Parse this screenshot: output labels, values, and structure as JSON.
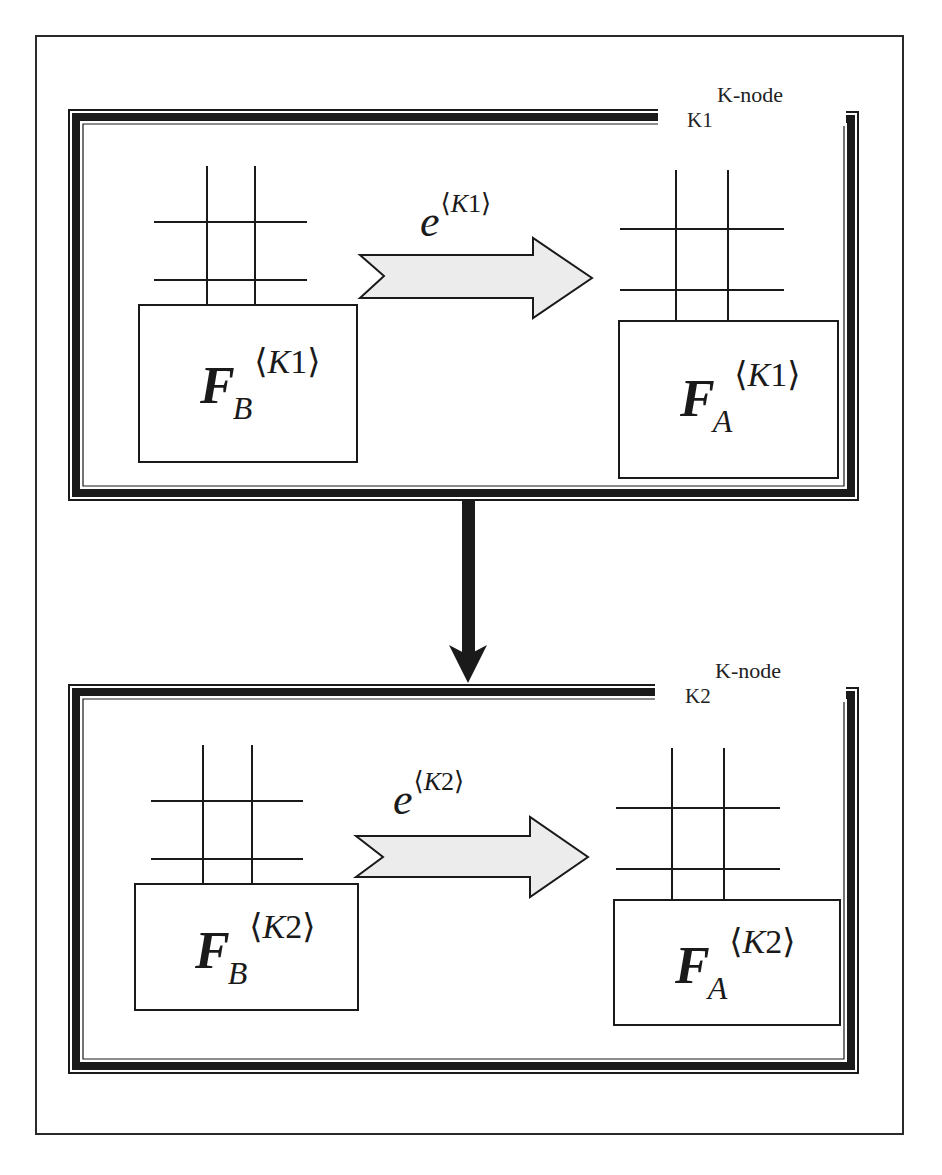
{
  "diagram": {
    "outer_frame": true,
    "colors": {
      "frame": "#1a1a1a",
      "arrow_fill": "#ececec",
      "arrow_stroke": "#1a1a1a",
      "background": "#ffffff"
    },
    "nodes": [
      {
        "id": "K1",
        "type_label": "K-node",
        "id_label": "K1",
        "left_box": {
          "base": "F",
          "sub": "B",
          "sup_open": "⟨",
          "sup_var": "K",
          "sup_num": "1",
          "sup_close": "⟩"
        },
        "right_box": {
          "base": "F",
          "sub": "A",
          "sup_open": "⟨",
          "sup_var": "K",
          "sup_num": "1",
          "sup_close": "⟩"
        },
        "edge": {
          "base": "e",
          "sup_open": "⟨",
          "sup_var": "K",
          "sup_num": "1",
          "sup_close": "⟩"
        }
      },
      {
        "id": "K2",
        "type_label": "K-node",
        "id_label": "K2",
        "left_box": {
          "base": "F",
          "sub": "B",
          "sup_open": "⟨",
          "sup_var": "K",
          "sup_num": "2",
          "sup_close": "⟩"
        },
        "right_box": {
          "base": "F",
          "sub": "A",
          "sup_open": "⟨",
          "sup_var": "K",
          "sup_num": "2",
          "sup_close": "⟩"
        },
        "edge": {
          "base": "e",
          "sup_open": "⟨",
          "sup_var": "K",
          "sup_num": "2",
          "sup_close": "⟩"
        }
      }
    ],
    "connections": [
      {
        "from": "K1",
        "to": "K2",
        "style": "thick-black-arrow-down"
      }
    ]
  }
}
